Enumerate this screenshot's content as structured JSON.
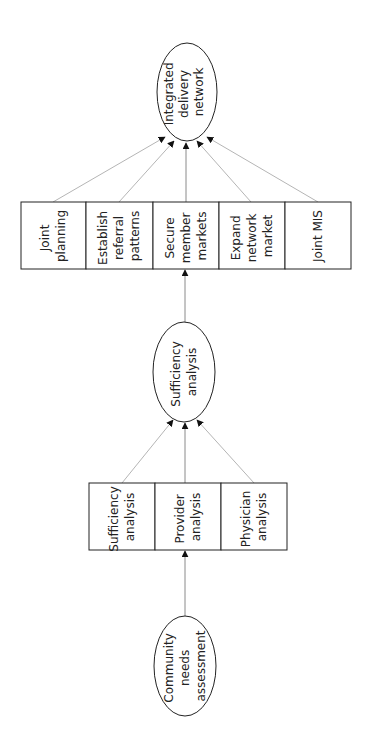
{
  "diagram": {
    "orientation": "rotated-90-ccw",
    "nodes": {
      "top_ellipse": {
        "lines": [
          "Integrated",
          "delivery",
          "network"
        ]
      },
      "top_boxes": [
        {
          "lines": [
            "Joint",
            "planning"
          ]
        },
        {
          "lines": [
            "Establish",
            "referral",
            "patterns"
          ]
        },
        {
          "lines": [
            "Secure",
            "member",
            "markets"
          ]
        },
        {
          "lines": [
            "Expand",
            "network",
            "market"
          ]
        },
        {
          "lines": [
            "Joint MIS"
          ]
        }
      ],
      "middle_ellipse": {
        "lines": [
          "Sufficiency",
          "analysis"
        ]
      },
      "bottom_boxes": [
        {
          "lines": [
            "Sufficiency",
            "analysis"
          ]
        },
        {
          "lines": [
            "Provider",
            "analysis"
          ]
        },
        {
          "lines": [
            "Physician",
            "analysis"
          ]
        }
      ],
      "bottom_ellipse": {
        "lines": [
          "Community",
          "needs",
          "assessment"
        ]
      }
    },
    "edges": [
      {
        "from": "Community needs assessment",
        "to": "Provider analysis"
      },
      {
        "from": "Sufficiency analysis (box)",
        "to": "Sufficiency analysis (ellipse)"
      },
      {
        "from": "Provider analysis",
        "to": "Sufficiency analysis (ellipse)"
      },
      {
        "from": "Physician analysis",
        "to": "Sufficiency analysis (ellipse)"
      },
      {
        "from": "Sufficiency analysis (ellipse)",
        "to": "Secure member markets"
      },
      {
        "from": "Joint planning",
        "to": "Integrated delivery network"
      },
      {
        "from": "Establish referral patterns",
        "to": "Integrated delivery network"
      },
      {
        "from": "Secure member markets",
        "to": "Integrated delivery network"
      },
      {
        "from": "Expand network market",
        "to": "Integrated delivery network"
      },
      {
        "from": "Joint MIS",
        "to": "Integrated delivery network"
      }
    ],
    "colors": {
      "stroke": "#222222",
      "connector": "#b5b5b5",
      "background": "#ffffff"
    }
  }
}
